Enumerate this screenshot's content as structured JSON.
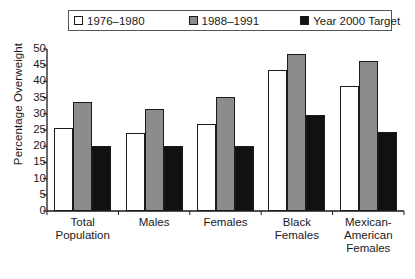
{
  "chart_data": {
    "type": "bar",
    "title": "",
    "xlabel": "",
    "ylabel": "Percentage Overweight",
    "ylim": [
      0,
      50
    ],
    "ytick_step": 5,
    "yticks": [
      0,
      5,
      10,
      15,
      20,
      25,
      30,
      35,
      40,
      45,
      50
    ],
    "grid": false,
    "legend_position": "top",
    "categories": [
      "Total\nPopulation",
      "Males",
      "Females",
      "Black\nFemales",
      "Mexican-\nAmerican\nFemales"
    ],
    "series": [
      {
        "name": "1976–1980",
        "color": "#ffffff",
        "values": [
          25.5,
          24.1,
          26.8,
          43.4,
          38.5
        ]
      },
      {
        "name": "1988–1991",
        "color": "#8c8c8c",
        "values": [
          33.7,
          31.5,
          35.3,
          48.6,
          46.4
        ]
      },
      {
        "name": "Year 2000 Target",
        "color": "#111111",
        "values": [
          20.0,
          20.0,
          20.0,
          29.6,
          24.4
        ]
      }
    ]
  },
  "legend": {
    "items": [
      {
        "label": "1976–1980",
        "swatch": "white"
      },
      {
        "label": "1988–1991",
        "swatch": "gray"
      },
      {
        "label": "Year 2000 Target",
        "swatch": "black"
      }
    ]
  },
  "axis": {
    "y_title": "Percentage Overweight"
  }
}
